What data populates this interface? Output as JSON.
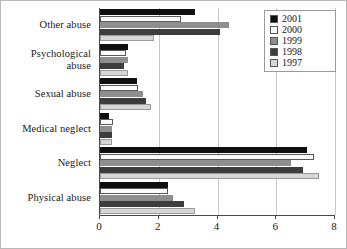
{
  "chart_data": {
    "type": "bar",
    "orientation": "horizontal",
    "title": "",
    "xlabel": "",
    "ylabel": "",
    "xlim": [
      0,
      8
    ],
    "xticks": [
      0,
      2,
      4,
      6,
      8
    ],
    "grid": true,
    "legend_position": "top-right",
    "categories": [
      "Other abuse",
      "Psychological\nabuse",
      "Sexual abuse",
      "Medical neglect",
      "Neglect",
      "Physical abuse"
    ],
    "series": [
      {
        "name": "2001",
        "color": "#101010",
        "values": [
          3.25,
          0.95,
          1.25,
          0.3,
          7.05,
          2.3
        ]
      },
      {
        "name": "2000",
        "color": "#fbfbfb",
        "values": [
          2.75,
          0.9,
          1.3,
          0.45,
          7.3,
          2.3
        ]
      },
      {
        "name": "1999",
        "color": "#8e8e8e",
        "values": [
          4.4,
          0.95,
          1.45,
          0.4,
          6.5,
          2.5
        ]
      },
      {
        "name": "1998",
        "color": "#3d3d3d",
        "values": [
          4.1,
          0.8,
          1.55,
          0.4,
          6.9,
          2.85
        ]
      },
      {
        "name": "1997",
        "color": "#d6d6d6",
        "values": [
          1.85,
          0.95,
          1.75,
          0.4,
          7.45,
          3.25
        ]
      }
    ]
  },
  "legend": {
    "items": [
      {
        "label": "2001"
      },
      {
        "label": "2000"
      },
      {
        "label": "1999"
      },
      {
        "label": "1998"
      },
      {
        "label": "1997"
      }
    ]
  },
  "axis": {
    "x_tick_labels": [
      "0",
      "2",
      "4",
      "6",
      "8"
    ]
  }
}
